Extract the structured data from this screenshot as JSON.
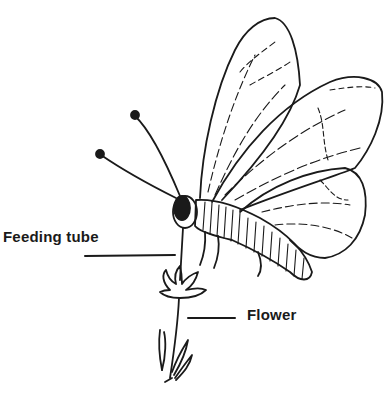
{
  "diagram": {
    "labels": [
      {
        "id": "feeding-tube",
        "text": "Feeding tube"
      },
      {
        "id": "flower",
        "text": "Flower"
      }
    ],
    "colors": {
      "ink": "#1a1a1a",
      "background": "#ffffff"
    }
  }
}
